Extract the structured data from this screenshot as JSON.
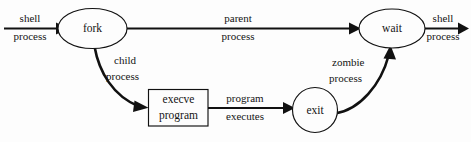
{
  "diagram": {
    "type": "flow-diagram",
    "background_color": "#fdfdfd",
    "stroke_color": "#111111",
    "text_color": "#141414",
    "nodes": [
      {
        "id": "fork",
        "label": "fork",
        "shape": "ellipse"
      },
      {
        "id": "execve",
        "label_line1": "execve",
        "label_line2": "program",
        "shape": "rectangle"
      },
      {
        "id": "exit",
        "label": "exit",
        "shape": "circle"
      },
      {
        "id": "wait",
        "label": "wait",
        "shape": "ellipse"
      }
    ],
    "edges": [
      {
        "id": "entry",
        "from": "",
        "to": "fork",
        "label_line1": "shell",
        "label_line2": "process",
        "style": "straight"
      },
      {
        "id": "parent",
        "from": "fork",
        "to": "wait",
        "label_line1": "parent",
        "label_line2": "process",
        "style": "straight"
      },
      {
        "id": "child",
        "from": "fork",
        "to": "execve",
        "label_line1": "child",
        "label_line2": "process",
        "style": "curved"
      },
      {
        "id": "program",
        "from": "execve",
        "to": "exit",
        "label_line1": "program",
        "label_line2": "executes",
        "style": "straight"
      },
      {
        "id": "zombie",
        "from": "exit",
        "to": "wait",
        "label_line1": "zombie",
        "label_line2": "process",
        "style": "curved"
      },
      {
        "id": "exitflow",
        "from": "wait",
        "to": "",
        "label_line1": "shell",
        "label_line2": "process",
        "style": "straight"
      }
    ]
  }
}
